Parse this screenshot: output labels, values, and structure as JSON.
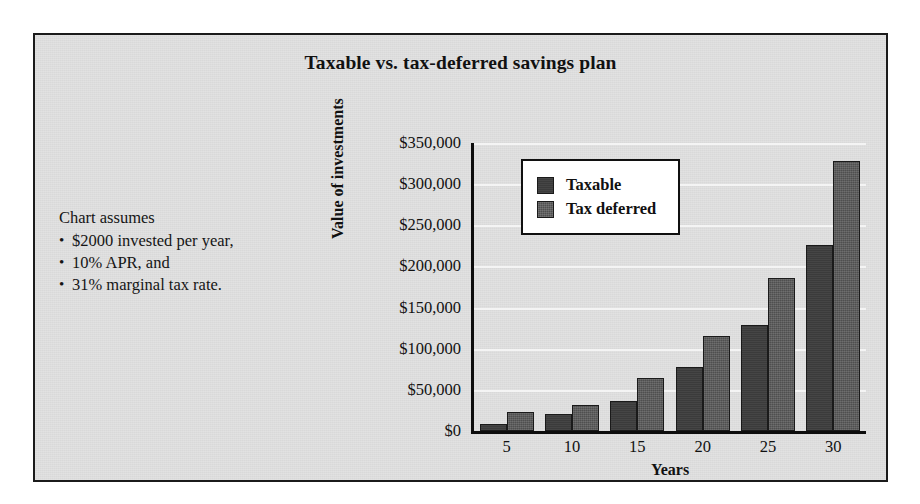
{
  "figure": {
    "background_color": "#d9d9d9",
    "border_color": "#1b1b1b"
  },
  "assumptions": {
    "heading": "Chart assumes",
    "items": [
      "$2000 invested per year,",
      "10% APR, and",
      "31% marginal tax rate."
    ]
  },
  "legend": {
    "position": "inside-top-left",
    "entries": [
      {
        "label": "Taxable",
        "color": "#3b3b3b"
      },
      {
        "label": "Tax deferred",
        "color": "#4f4f4f"
      }
    ]
  },
  "chart_data": {
    "type": "bar",
    "title": "Taxable vs. tax-deferred savings plan",
    "xlabel": "Years",
    "ylabel": "Value of investments",
    "categories": [
      "5",
      "10",
      "15",
      "20",
      "25",
      "30"
    ],
    "series": [
      {
        "name": "Taxable",
        "color": "#3b3b3b",
        "values": [
          9000,
          21000,
          37000,
          78000,
          129000,
          226000
        ]
      },
      {
        "name": "Tax deferred",
        "color": "#4f4f4f",
        "values": [
          23000,
          32000,
          65000,
          115000,
          186000,
          328000
        ]
      }
    ],
    "ylim": [
      0,
      350000
    ],
    "ytick_values": [
      0,
      50000,
      100000,
      150000,
      200000,
      250000,
      300000,
      350000
    ],
    "ytick_labels": [
      "$0",
      "$50,000",
      "$100,000",
      "$150,000",
      "$200,000",
      "$250,000",
      "$300,000",
      "$350,000"
    ],
    "grid": true,
    "grid_color": "#f4f4f4",
    "legend_position": "upper left"
  }
}
